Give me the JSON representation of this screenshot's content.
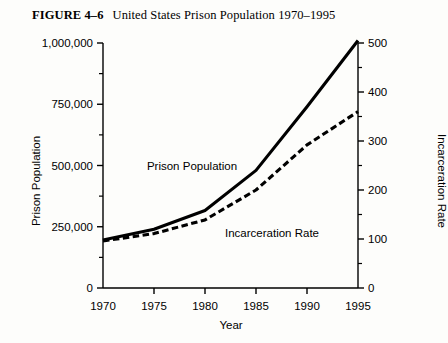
{
  "figure": {
    "number": "FIGURE 4–6",
    "caption": "United States Prison Population 1970–1995"
  },
  "chart_data": {
    "type": "line",
    "title": "United States Prison Population 1970–1995",
    "xlabel": "Year",
    "ylabel": "Prison Population",
    "y2label": "Incarceration Rate",
    "x": [
      1970,
      1975,
      1980,
      1985,
      1990,
      1995
    ],
    "xlim": [
      1970,
      1995
    ],
    "xticks": [
      1970,
      1975,
      1980,
      1985,
      1990,
      1995
    ],
    "xtick_labels": [
      "1970",
      "1975",
      "1980",
      "1985",
      "1990",
      "1995"
    ],
    "ylim": [
      0,
      1000000
    ],
    "yticks": [
      0,
      250000,
      500000,
      750000,
      1000000
    ],
    "ytick_labels": [
      "0",
      "250,000",
      "500,000",
      "750,000",
      "1,000,000"
    ],
    "y_minor_ticks": [
      125000,
      375000,
      625000,
      875000
    ],
    "y2lim": [
      0,
      500
    ],
    "y2ticks": [
      0,
      100,
      200,
      300,
      400,
      500
    ],
    "y2tick_labels": [
      "0",
      "100",
      "200",
      "300",
      "400",
      "500"
    ],
    "y2_minor_ticks": [
      50,
      150,
      250,
      350,
      450
    ],
    "grid": false,
    "legend": "inline-annotations",
    "series": [
      {
        "name": "Prison Population",
        "axis": "left",
        "style": "solid",
        "values": [
          196000,
          240000,
          316000,
          480000,
          740000,
          1010000
        ],
        "annotation": "Prison Population"
      },
      {
        "name": "Incarceration Rate",
        "axis": "right",
        "style": "dashed",
        "values": [
          96,
          111,
          139,
          200,
          292,
          360
        ],
        "annotation": "Incarceration Rate"
      }
    ]
  }
}
